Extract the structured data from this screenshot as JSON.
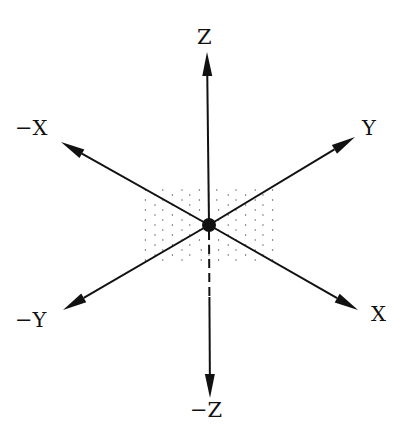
{
  "diagram": {
    "colors": {
      "ink": "#111111",
      "dots": "#555555",
      "background": "#ffffff"
    },
    "axes": [
      {
        "id": "z_pos",
        "label": "Z",
        "direction": "up",
        "style": "solid"
      },
      {
        "id": "z_neg",
        "label": "−Z",
        "direction": "down",
        "style": "dashed-near-origin"
      },
      {
        "id": "x_neg",
        "label": "−X",
        "direction": "upper-left",
        "style": "solid"
      },
      {
        "id": "x_pos",
        "label": "X",
        "direction": "lower-right",
        "style": "solid"
      },
      {
        "id": "y_pos",
        "label": "Y",
        "direction": "upper-right",
        "style": "solid"
      },
      {
        "id": "y_neg",
        "label": "−Y",
        "direction": "lower-left",
        "style": "solid"
      }
    ],
    "origin": {
      "label": "",
      "marker": "filled-dot"
    },
    "plane": {
      "name": "XY plane",
      "style": "dotted-diamond"
    }
  }
}
